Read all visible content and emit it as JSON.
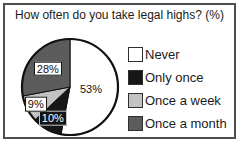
{
  "title": "How often do you take legal highs? (%)",
  "chart_data": {
    "type": "pie",
    "title": "How often do you take legal highs? (%)",
    "unit": "%",
    "labels": [
      "Never",
      "Only once",
      "Once a week",
      "Once a month"
    ],
    "values": [
      53,
      10,
      9,
      28
    ],
    "slice_labels": [
      "53%",
      "10%",
      "9%",
      "28%"
    ],
    "colors": [
      "#ffffff",
      "#161616",
      "#c2c2c2",
      "#5c5c5c"
    ],
    "label_styles": [
      "plain",
      "dark-box",
      "light-box",
      "light-box"
    ],
    "start_angle_deg": -90,
    "direction": "clockwise",
    "legend_position": "right",
    "outline_color": "#111111"
  }
}
